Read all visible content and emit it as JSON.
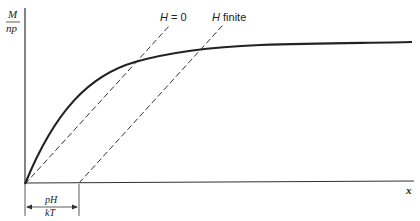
{
  "diagram": {
    "type": "magnetization-vs-x",
    "y_axis_label": {
      "numerator": "M",
      "denominator": "np"
    },
    "x_axis_label": "x",
    "lines": [
      {
        "name": "H = 0",
        "label_italic": "H",
        "label_rest": " = 0",
        "style": "dashed"
      },
      {
        "name": "H finite",
        "label_italic": "H",
        "label_rest": " finite",
        "style": "dashed"
      }
    ],
    "curve": {
      "name": "magnetization curve",
      "style": "solid-thick"
    },
    "offset_annotation": {
      "numerator": "pH",
      "denominator": "kT"
    }
  },
  "colors": {
    "ink": "#222222",
    "background": "#ffffff"
  }
}
